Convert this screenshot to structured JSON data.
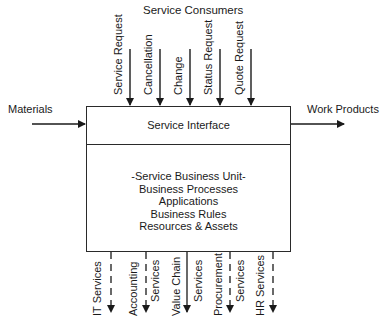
{
  "diagram": {
    "title": "Service Consumers",
    "inputs": {
      "left": {
        "label": "Materials"
      },
      "right": {
        "label": "Work Products"
      }
    },
    "top_requests": [
      {
        "label": "Service Request"
      },
      {
        "label": "Cancellation"
      },
      {
        "label": "Change"
      },
      {
        "label": "Status Request"
      },
      {
        "label": "Quote Request"
      }
    ],
    "box": {
      "interface_label": "Service Interface",
      "unit_lines": [
        "-Service Business Unit-",
        "Business Processes",
        "Applications",
        "Business Rules",
        "Resources & Assets"
      ]
    },
    "bottom_services": [
      {
        "label_left": "IT Services",
        "label_right": "",
        "style": "dashed"
      },
      {
        "label_left": "Accounting",
        "label_right": "Services",
        "style": "dashed"
      },
      {
        "label_left": "Value Chain",
        "label_right": "Services",
        "style": "solid"
      },
      {
        "label_left": "Procurement",
        "label_right": "Services",
        "style": "dashed"
      },
      {
        "label_left": "HR Services",
        "label_right": "",
        "style": "dashed"
      }
    ],
    "colors": {
      "line": "#1a1a1a",
      "background": "#ffffff"
    }
  }
}
